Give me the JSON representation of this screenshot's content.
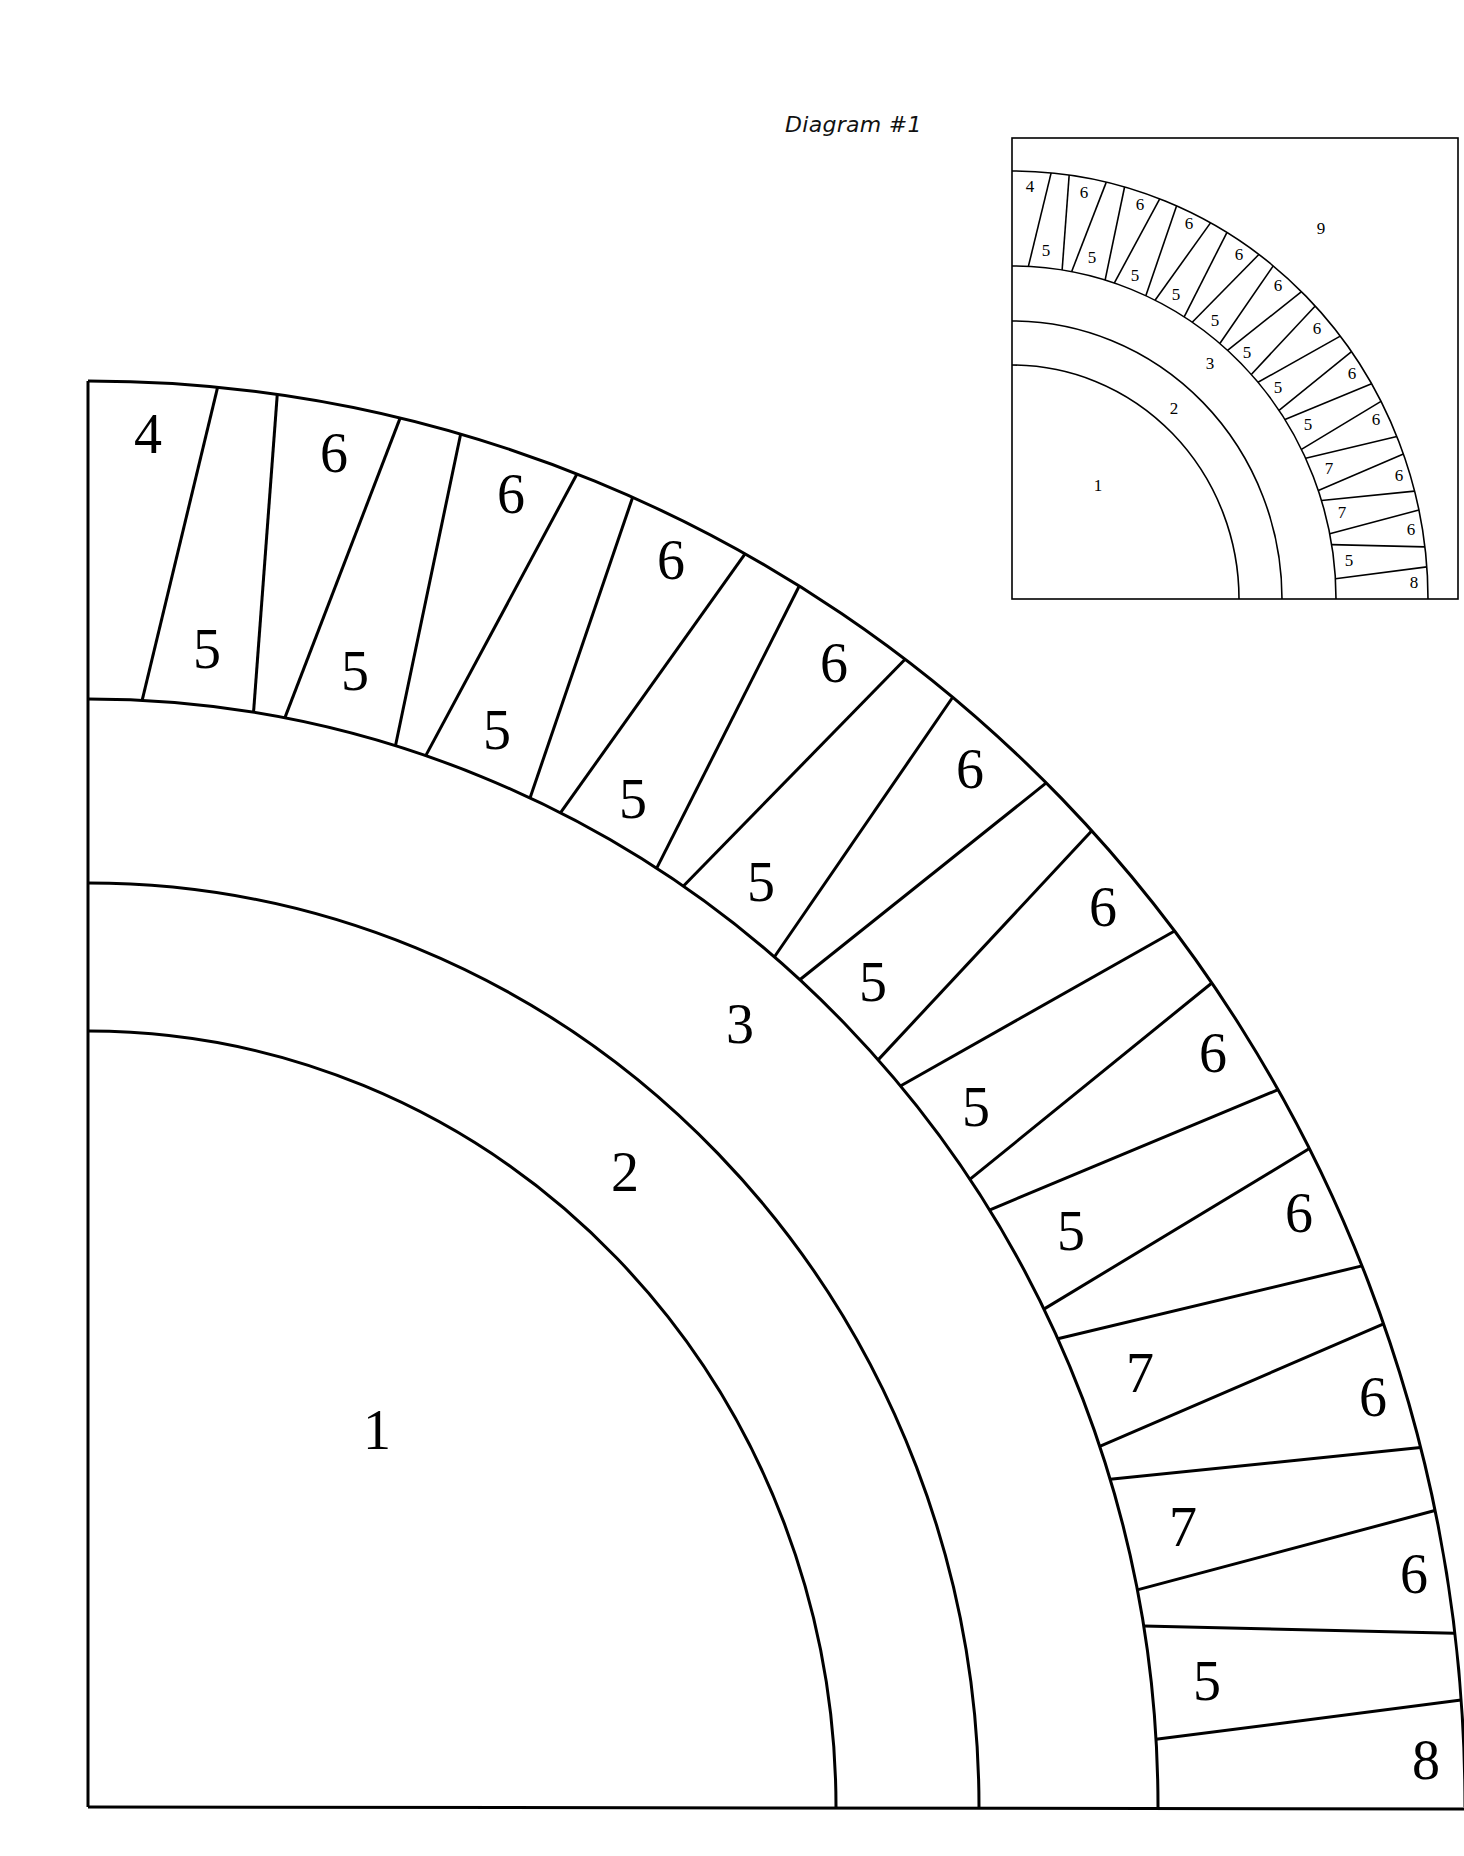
{
  "caption": "Diagram #1",
  "colors": {
    "line": "#000000",
    "background": "#ffffff"
  },
  "spokes_deg": [
    [
      5.4,
      2.9
    ],
    [
      7.9,
      8.9
    ],
    [
      13.1,
      10.6
    ],
    [
      15.7,
      16.7
    ],
    [
      20.8,
      18.4
    ],
    [
      23.3,
      24.4
    ],
    [
      28.5,
      26.2
    ],
    [
      31.1,
      32.1
    ],
    [
      36.4,
      33.8
    ],
    [
      38.9,
      39.9
    ],
    [
      44.1,
      41.7
    ],
    [
      46.8,
      47.6
    ],
    [
      52.1,
      49.4
    ],
    [
      54.7,
      55.5
    ],
    [
      59.8,
      57.4
    ],
    [
      62.5,
      63.3
    ],
    [
      67.7,
      65.0
    ],
    [
      70.2,
      71.0
    ],
    [
      75.4,
      72.8
    ],
    [
      78.0,
      78.7
    ],
    [
      83.0,
      80.6
    ],
    [
      85.7,
      86.5
    ]
  ],
  "main_diagram": {
    "center": [
      88,
      1807
    ],
    "radii": {
      "arc1": [
        748,
        776
      ],
      "arc2": [
        891,
        924
      ],
      "ring_inner": [
        1070,
        1108
      ],
      "ring_outer": [
        1377,
        1426
      ]
    },
    "stroke": 3,
    "labels": [
      {
        "text": "1",
        "x": 377,
        "y": 1430
      },
      {
        "text": "2",
        "x": 625,
        "y": 1172
      },
      {
        "text": "3",
        "x": 740,
        "y": 1024
      },
      {
        "text": "4",
        "x": 148,
        "y": 434
      },
      {
        "text": "6",
        "x": 334,
        "y": 453
      },
      {
        "text": "6",
        "x": 511,
        "y": 494
      },
      {
        "text": "6",
        "x": 671,
        "y": 560
      },
      {
        "text": "6",
        "x": 834,
        "y": 663
      },
      {
        "text": "6",
        "x": 970,
        "y": 769
      },
      {
        "text": "6",
        "x": 1103,
        "y": 907
      },
      {
        "text": "6",
        "x": 1213,
        "y": 1053
      },
      {
        "text": "6",
        "x": 1299,
        "y": 1213
      },
      {
        "text": "6",
        "x": 1373,
        "y": 1397
      },
      {
        "text": "6",
        "x": 1414,
        "y": 1574
      },
      {
        "text": "5",
        "x": 207,
        "y": 649
      },
      {
        "text": "5",
        "x": 355,
        "y": 671
      },
      {
        "text": "5",
        "x": 497,
        "y": 730
      },
      {
        "text": "5",
        "x": 633,
        "y": 799
      },
      {
        "text": "5",
        "x": 761,
        "y": 882
      },
      {
        "text": "5",
        "x": 873,
        "y": 982
      },
      {
        "text": "5",
        "x": 976,
        "y": 1107
      },
      {
        "text": "5",
        "x": 1071,
        "y": 1231
      },
      {
        "text": "7",
        "x": 1140,
        "y": 1373
      },
      {
        "text": "7",
        "x": 1183,
        "y": 1527
      },
      {
        "text": "5",
        "x": 1207,
        "y": 1681
      },
      {
        "text": "8",
        "x": 1426,
        "y": 1760
      }
    ]
  },
  "inset_diagram": {
    "box": {
      "x": 1012,
      "y": 138,
      "w": 446,
      "h": 461
    },
    "center": [
      1012,
      599
    ],
    "radii": {
      "arc1": [
        227,
        234
      ],
      "arc2": [
        270,
        278
      ],
      "ring_inner": [
        324,
        333
      ],
      "ring_outer": [
        416,
        428
      ]
    },
    "stroke": 1.6,
    "labels": [
      {
        "text": "1",
        "x": 1098,
        "y": 485
      },
      {
        "text": "2",
        "x": 1174,
        "y": 408
      },
      {
        "text": "3",
        "x": 1210,
        "y": 363
      },
      {
        "text": "4",
        "x": 1030,
        "y": 186
      },
      {
        "text": "9",
        "x": 1321,
        "y": 228
      },
      {
        "text": "6",
        "x": 1084,
        "y": 192
      },
      {
        "text": "6",
        "x": 1140,
        "y": 204
      },
      {
        "text": "6",
        "x": 1189,
        "y": 223
      },
      {
        "text": "6",
        "x": 1239,
        "y": 254
      },
      {
        "text": "6",
        "x": 1278,
        "y": 285
      },
      {
        "text": "6",
        "x": 1317,
        "y": 328
      },
      {
        "text": "6",
        "x": 1352,
        "y": 373
      },
      {
        "text": "6",
        "x": 1376,
        "y": 419
      },
      {
        "text": "6",
        "x": 1399,
        "y": 475
      },
      {
        "text": "6",
        "x": 1411,
        "y": 529
      },
      {
        "text": "5",
        "x": 1046,
        "y": 250
      },
      {
        "text": "5",
        "x": 1092,
        "y": 257
      },
      {
        "text": "5",
        "x": 1135,
        "y": 275
      },
      {
        "text": "5",
        "x": 1176,
        "y": 294
      },
      {
        "text": "5",
        "x": 1215,
        "y": 320
      },
      {
        "text": "5",
        "x": 1247,
        "y": 352
      },
      {
        "text": "5",
        "x": 1278,
        "y": 387
      },
      {
        "text": "5",
        "x": 1308,
        "y": 424
      },
      {
        "text": "7",
        "x": 1329,
        "y": 468
      },
      {
        "text": "7",
        "x": 1342,
        "y": 512
      },
      {
        "text": "5",
        "x": 1349,
        "y": 560
      },
      {
        "text": "8",
        "x": 1414,
        "y": 582
      }
    ]
  }
}
